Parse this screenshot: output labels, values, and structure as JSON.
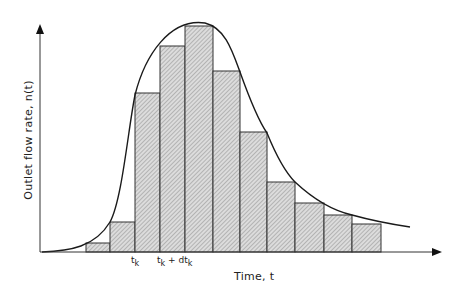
{
  "chart_data": {
    "type": "bar",
    "title": "",
    "xlabel": "Time, t",
    "ylabel": "Outlet flow rate, n(t)",
    "bar_edges_px": [
      86,
      110,
      135,
      160,
      185,
      213,
      240,
      267,
      295,
      324,
      352,
      381
    ],
    "bar_tops_px": [
      243,
      222,
      93,
      46,
      26,
      71,
      132,
      182,
      203,
      215,
      224
    ],
    "values_relative": [
      0.04,
      0.13,
      0.7,
      0.91,
      1.0,
      0.8,
      0.53,
      0.31,
      0.22,
      0.16,
      0.12
    ],
    "baseline_px": 252,
    "curve": "smooth unimodal skewed curve rising steeply near t_k, peak near center, long right tail",
    "tick_labels": [
      "t_k",
      "t_k + dt_k"
    ],
    "grid": false,
    "legend": null,
    "colors": {
      "line": "#1a1a1a",
      "bar_fill": "#d9d9d9",
      "hatch": "#7a7a7a",
      "background": "#ffffff"
    }
  },
  "labels": {
    "y_axis": "Outlet flow rate, n(t)",
    "x_axis": "Time, t",
    "tick1_main": "t",
    "tick1_sub": "k",
    "tick2_main": "t",
    "tick2_sub": "k",
    "tick2_plus": " + dt",
    "tick2_sub2": "k"
  }
}
